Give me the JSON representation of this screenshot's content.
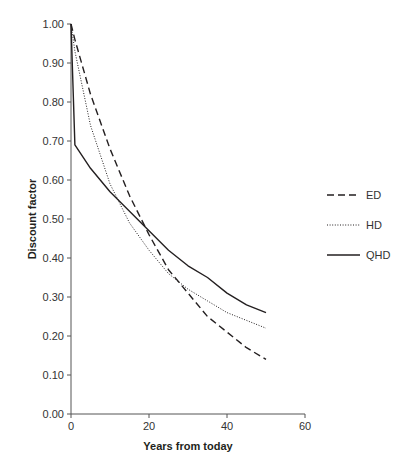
{
  "chart_data": {
    "type": "line",
    "title": "",
    "xlabel": "Years from today",
    "ylabel": "Discount factor",
    "xlim": [
      0,
      60
    ],
    "ylim": [
      0,
      1.0
    ],
    "x_ticks": [
      0,
      20,
      40,
      60
    ],
    "x_tick_labels": [
      "0",
      "20",
      "40",
      "60"
    ],
    "y_ticks": [
      0,
      0.1,
      0.2,
      0.3,
      0.4,
      0.5,
      0.6,
      0.7,
      0.8,
      0.9,
      1.0
    ],
    "y_tick_labels": [
      "0.00",
      "0.10",
      "0.20",
      "0.30",
      "0.40",
      "0.50",
      "0.60",
      "0.70",
      "0.80",
      "0.90",
      "1.00"
    ],
    "grid": false,
    "legend_position": "right",
    "series": [
      {
        "name": "ED",
        "style": "dashed",
        "x": [
          0,
          1,
          5,
          10,
          15,
          20,
          25,
          30,
          35,
          40,
          45,
          50
        ],
        "y": [
          1.0,
          0.96,
          0.82,
          0.68,
          0.56,
          0.46,
          0.37,
          0.31,
          0.25,
          0.21,
          0.17,
          0.14
        ]
      },
      {
        "name": "HD",
        "style": "dotted",
        "x": [
          0,
          1,
          5,
          10,
          15,
          20,
          25,
          30,
          35,
          40,
          45,
          50
        ],
        "y": [
          1.0,
          0.93,
          0.74,
          0.59,
          0.49,
          0.42,
          0.36,
          0.32,
          0.29,
          0.26,
          0.24,
          0.22
        ]
      },
      {
        "name": "QHD",
        "style": "solid",
        "x": [
          0,
          1,
          5,
          10,
          15,
          20,
          25,
          30,
          35,
          40,
          45,
          50
        ],
        "y": [
          1.0,
          0.69,
          0.63,
          0.57,
          0.52,
          0.47,
          0.42,
          0.38,
          0.35,
          0.31,
          0.28,
          0.26
        ]
      }
    ]
  }
}
